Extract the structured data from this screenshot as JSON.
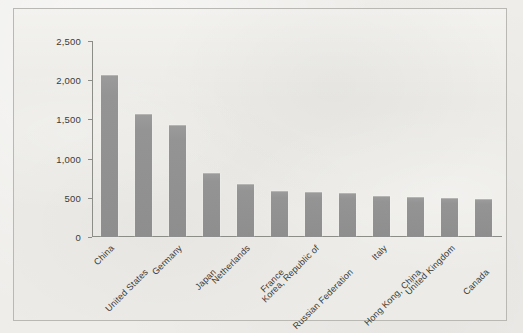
{
  "chart_data": {
    "type": "bar",
    "title": "",
    "subtitle": "",
    "xlabel": "",
    "ylabel": "$ billions",
    "ylim": [
      0,
      2500
    ],
    "ytick_labels": [
      "2,500",
      "2,000",
      "1,500",
      "1,000",
      "500",
      "0"
    ],
    "ytick_values": [
      2500,
      2000,
      1500,
      1000,
      500,
      0
    ],
    "grid": false,
    "legend": false,
    "bar_color": "#949494",
    "categories": [
      "China",
      "United States",
      "Germany",
      "Japan",
      "Netherlands",
      "France",
      "Korea, Republic of",
      "Russian Federation",
      "Italy",
      "Hong Kong, China",
      "United Kingdom",
      "Canada"
    ],
    "values": [
      2050,
      1550,
      1420,
      805,
      665,
      580,
      565,
      545,
      515,
      495,
      485,
      470
    ]
  },
  "figure": {
    "background_color": "#ecebe7",
    "border_color": "#b9b8b3",
    "axis_color": "#8d8d88",
    "text_color": "#3a3a38"
  }
}
